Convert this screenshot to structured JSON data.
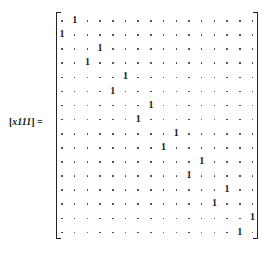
{
  "label": {
    "text": "[x111] =",
    "bracket_open": "[",
    "var": "x111",
    "bracket_close": "]",
    "equals": "="
  },
  "matrix": {
    "rows": 16,
    "cols": 16,
    "zero_symbol": "·",
    "one_symbol": "1",
    "ones_col_per_row": [
      1,
      0,
      3,
      2,
      5,
      4,
      7,
      6,
      9,
      8,
      11,
      10,
      13,
      12,
      15,
      14
    ]
  }
}
